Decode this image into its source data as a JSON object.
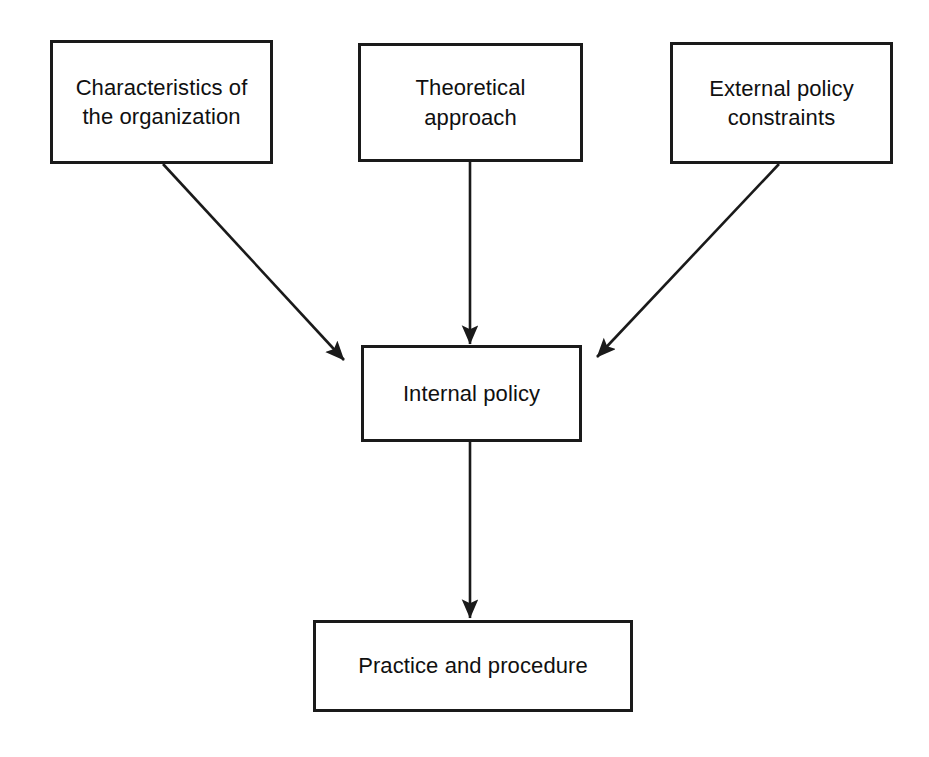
{
  "diagram": {
    "background_color": "#ffffff",
    "stroke_color": "#1a1a1a",
    "text_color": "#101010",
    "nodes": [
      {
        "id": "characteristics",
        "label": "Characteristics of\nthe organization",
        "shape": "rectangle"
      },
      {
        "id": "theoretical",
        "label": "Theoretical\napproach",
        "shape": "rectangle"
      },
      {
        "id": "external",
        "label": "External policy\nconstraints",
        "shape": "rectangle"
      },
      {
        "id": "internal",
        "label": "Internal policy",
        "shape": "rectangle"
      },
      {
        "id": "practice",
        "label": "Practice and procedure",
        "shape": "rectangle"
      }
    ],
    "edges": [
      {
        "id": "characteristics-to-internal",
        "from": "characteristics",
        "to": "internal",
        "style": "solid",
        "arrowhead": "filled-triangle",
        "direction": "diagonal-down-right"
      },
      {
        "id": "theoretical-to-internal",
        "from": "theoretical",
        "to": "internal",
        "style": "solid",
        "arrowhead": "filled-triangle",
        "direction": "vertical-down"
      },
      {
        "id": "external-to-internal",
        "from": "external",
        "to": "internal",
        "style": "solid",
        "arrowhead": "filled-triangle",
        "direction": "diagonal-down-left"
      },
      {
        "id": "internal-to-practice",
        "from": "internal",
        "to": "practice",
        "style": "solid",
        "arrowhead": "filled-triangle",
        "direction": "vertical-down"
      }
    ]
  }
}
